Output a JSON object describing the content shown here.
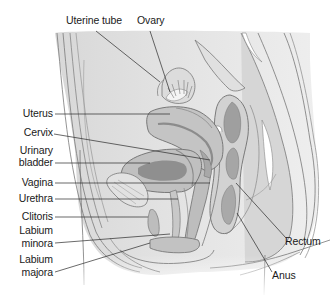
{
  "figure": {
    "colors": {
      "background": "#ffffff",
      "tissue_light": "#e6e6e6",
      "tissue_mid": "#c9c9c9",
      "tissue_dark": "#9e9e9e",
      "outline": "#6e6e6e",
      "leader_line": "#2a2a2a",
      "label_text": "#1a1a1a"
    },
    "labels": [
      {
        "id": "uterine-tube",
        "text": "Uterine tube"
      },
      {
        "id": "ovary",
        "text": "Ovary"
      },
      {
        "id": "uterus",
        "text": "Uterus"
      },
      {
        "id": "cervix",
        "text": "Cervix"
      },
      {
        "id": "urinary-bladder-1",
        "text": "Urinary"
      },
      {
        "id": "urinary-bladder-2",
        "text": "bladder"
      },
      {
        "id": "vagina",
        "text": "Vagina"
      },
      {
        "id": "urethra",
        "text": "Urethra"
      },
      {
        "id": "clitoris",
        "text": "Clitoris"
      },
      {
        "id": "labium-minora-1",
        "text": "Labium"
      },
      {
        "id": "labium-minora-2",
        "text": "minora"
      },
      {
        "id": "labium-majora-1",
        "text": "Labium"
      },
      {
        "id": "labium-majora-2",
        "text": "majora"
      },
      {
        "id": "rectum",
        "text": "Rectum"
      },
      {
        "id": "anus",
        "text": "Anus"
      }
    ]
  }
}
